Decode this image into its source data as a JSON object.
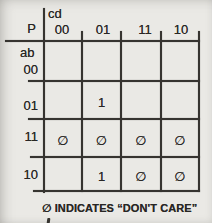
{
  "colors": {
    "background": "#eae9e5",
    "ink": "#2b2927"
  },
  "kmap": {
    "output_label": "P",
    "column_variables": "cd",
    "row_variables": "ab",
    "col_labels": [
      "00",
      "01",
      "11",
      "10"
    ],
    "row_labels": [
      "00",
      "01",
      "11",
      "10"
    ],
    "cells": [
      [
        "",
        "",
        "",
        ""
      ],
      [
        "",
        "1",
        "",
        ""
      ],
      [
        "∅",
        "∅",
        "∅",
        "∅"
      ],
      [
        "",
        "1",
        "∅",
        "∅"
      ]
    ],
    "dont_care_symbol": "∅"
  },
  "footer": {
    "note": "∅ INDICATES “DON'T CARE”"
  }
}
